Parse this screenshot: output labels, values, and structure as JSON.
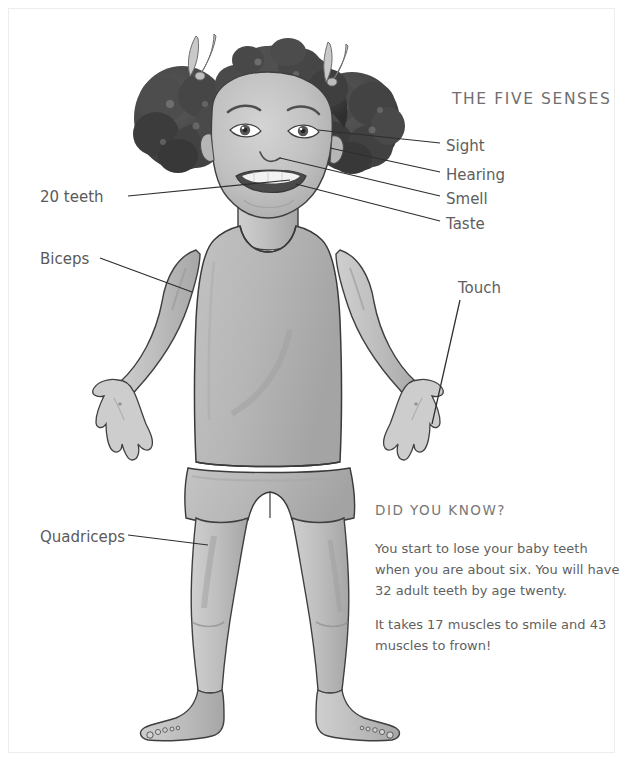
{
  "page": {
    "width": 625,
    "height": 763,
    "background": "#ffffff",
    "frame_color": "#ededed"
  },
  "illustration": {
    "name": "child-body-diagram",
    "description": "Watercolor illustration of a smiling child with curly pigtails and hair bows, wearing a sleeveless tank top and shorts, standing barefoot with arms out and hands open",
    "palette": {
      "skin": "#bdbdbd",
      "skin_shadow": "#a2a2a2",
      "skin_light": "#d2d2d2",
      "hair": "#4a4a4a",
      "hair_dark": "#343434",
      "clothing": "#b8b8b8",
      "clothing_shadow": "#a6a6a6",
      "outline": "#3a3a3a",
      "bow": "#c9c9c9"
    }
  },
  "senses_heading": "THE FIVE SENSES",
  "senses": [
    {
      "label": "Sight",
      "icon": "leader-line-icon"
    },
    {
      "label": "Hearing",
      "icon": "leader-line-icon"
    },
    {
      "label": "Smell",
      "icon": "leader-line-icon"
    },
    {
      "label": "Taste",
      "icon": "leader-line-icon"
    },
    {
      "label": "Touch",
      "icon": "leader-line-icon"
    }
  ],
  "body_parts": [
    {
      "label": "20 teeth",
      "icon": "leader-line-icon"
    },
    {
      "label": "Biceps",
      "icon": "leader-line-icon"
    },
    {
      "label": "Quadriceps",
      "icon": "leader-line-icon"
    }
  ],
  "did_you_know": {
    "heading": "DID YOU KNOW?",
    "paragraphs": [
      "You start to lose your baby teeth when you are about six.  You will have 32 adult teeth by age twenty.",
      "It takes 17 muscles to smile and 43 muscles to frown!"
    ]
  }
}
